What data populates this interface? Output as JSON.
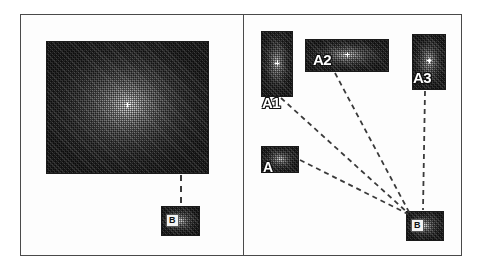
{
  "figure": {
    "background_color": "#ffffff",
    "panel_border_color": "#4a4a4a",
    "tile_border_color": "#1a1a1a",
    "link_color": "#3a3a3a",
    "label_color": "#ffffff"
  },
  "panels": [
    {
      "id": "left",
      "name": "left-panel"
    },
    {
      "id": "right",
      "name": "right-panel"
    }
  ],
  "left_panel": {
    "main_image": {
      "label": "",
      "kind": "halftone-radial-gradient"
    },
    "detail_tile": {
      "label": "B",
      "kind": "halftone-radial-gradient"
    },
    "connections": [
      {
        "from": "main_image",
        "to": "detail_tile",
        "style": "dashed"
      }
    ]
  },
  "right_panel": {
    "tiles": [
      {
        "id": "a1",
        "label": "A1",
        "kind": "halftone-radial-gradient"
      },
      {
        "id": "a2",
        "label": "A2",
        "kind": "halftone-radial-gradient"
      },
      {
        "id": "a3",
        "label": "A3",
        "kind": "halftone-radial-gradient"
      },
      {
        "id": "a",
        "label": "A",
        "kind": "halftone-radial-gradient"
      },
      {
        "id": "b",
        "label": "B",
        "kind": "halftone-radial-gradient"
      }
    ],
    "connections": [
      {
        "from": "a1",
        "to": "b",
        "style": "dashed"
      },
      {
        "from": "a2",
        "to": "b",
        "style": "dashed"
      },
      {
        "from": "a3",
        "to": "b",
        "style": "dashed"
      },
      {
        "from": "a",
        "to": "b",
        "style": "dashed"
      }
    ]
  }
}
